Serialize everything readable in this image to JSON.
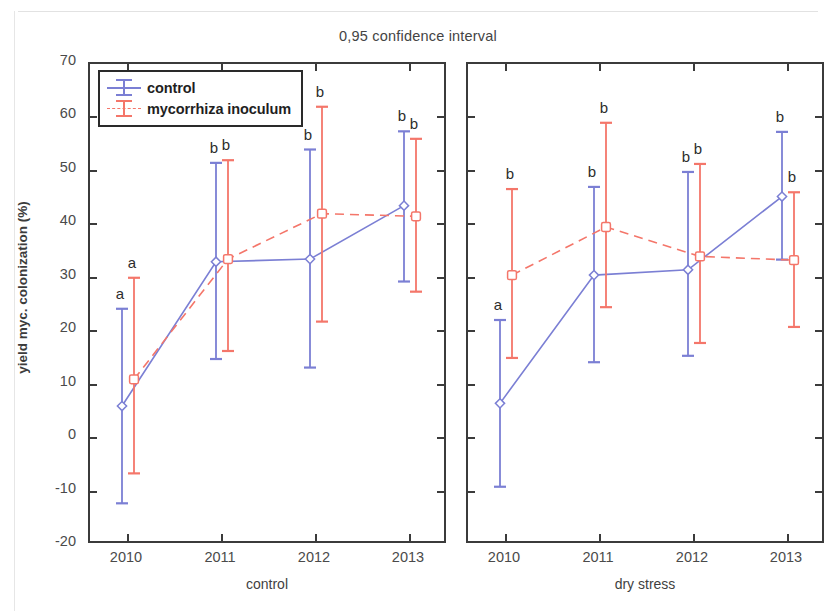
{
  "title": "0,95 confidence interval",
  "axes": {
    "ylabel": "yield myc. colonization (%)",
    "yticks": [
      "70",
      "60",
      "50",
      "40",
      "30",
      "20",
      "10",
      "0",
      "-10",
      "-20"
    ],
    "xticks": [
      "2010",
      "2011",
      "2012",
      "2013"
    ]
  },
  "legend": {
    "items": [
      {
        "label": "control",
        "color": "#7b7fd4",
        "style": "solid"
      },
      {
        "label": "mycorrhiza inoculum",
        "color": "#f4766a",
        "style": "dashed"
      }
    ]
  },
  "panels": [
    {
      "id": "control",
      "caption": "control"
    },
    {
      "id": "dry",
      "caption": "dry stress"
    }
  ],
  "colors": {
    "control": "#7b7fd4",
    "mycorrhiza": "#f4766a",
    "axis": "#3b3b3b",
    "text": "#3f3f3f"
  },
  "chart_data": {
    "type": "line",
    "title": "0,95 confidence interval",
    "xlabel": "",
    "ylabel": "yield myc. colonization (%)",
    "ylim": [
      -20,
      70
    ],
    "ytick_step": 10,
    "grid": false,
    "legend_position": "top-left",
    "error_bars": "0.95 confidence interval",
    "x": [
      "2010",
      "2011",
      "2012",
      "2013"
    ],
    "panels": [
      {
        "name": "control",
        "caption": "control",
        "series": [
          {
            "name": "control",
            "color": "#7b7fd4",
            "style": "solid",
            "values": [
              6.0,
              33.0,
              33.5,
              43.5
            ],
            "ci_low": [
              -12.2,
              14.8,
              13.2,
              29.3
            ],
            "ci_high": [
              24.2,
              51.5,
              54.0,
              57.4
            ],
            "sig_letters": [
              "a",
              "b",
              "b",
              "b"
            ]
          },
          {
            "name": "mycorrhiza inoculum",
            "color": "#f4766a",
            "style": "dashed",
            "values": [
              11.0,
              33.5,
              42.0,
              41.5
            ],
            "ci_low": [
              -6.6,
              16.3,
              21.8,
              27.4
            ],
            "ci_high": [
              30.0,
              52.0,
              62.0,
              56.0
            ],
            "sig_letters": [
              "a",
              "b",
              "b",
              "b"
            ]
          }
        ]
      },
      {
        "name": "dry stress",
        "caption": "dry stress",
        "series": [
          {
            "name": "control",
            "color": "#7b7fd4",
            "style": "solid",
            "values": [
              6.5,
              30.5,
              31.5,
              45.2
            ],
            "ci_low": [
              -9.1,
              14.2,
              15.4,
              33.4
            ],
            "ci_high": [
              22.1,
              47.0,
              49.8,
              57.3
            ],
            "sig_letters": [
              "a",
              "b",
              "b",
              "b"
            ]
          },
          {
            "name": "mycorrhiza inoculum",
            "color": "#f4766a",
            "style": "dashed",
            "values": [
              30.5,
              39.5,
              34.0,
              33.3
            ],
            "ci_low": [
              15.0,
              24.5,
              17.8,
              20.8
            ],
            "ci_high": [
              46.6,
              59.0,
              51.3,
              46.0
            ],
            "sig_letters": [
              "b",
              "b",
              "b",
              "b"
            ]
          }
        ]
      }
    ]
  }
}
